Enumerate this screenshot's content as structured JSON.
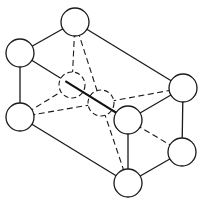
{
  "diagram": {
    "type": "crystal-lattice-unit-cell",
    "background": "#ffffff",
    "stroke_color": "#1a1a1a",
    "atom_radius": 14,
    "atoms": [
      {
        "id": "top",
        "x": 75,
        "y": 22,
        "style": "solid"
      },
      {
        "id": "upper-left",
        "x": 20,
        "y": 53,
        "style": "solid"
      },
      {
        "id": "left-mid",
        "x": 20,
        "y": 117,
        "style": "solid"
      },
      {
        "id": "right-upper",
        "x": 183,
        "y": 88,
        "style": "solid"
      },
      {
        "id": "right-lower",
        "x": 182,
        "y": 152,
        "style": "solid"
      },
      {
        "id": "bottom",
        "x": 128,
        "y": 183,
        "style": "solid"
      },
      {
        "id": "front-mid",
        "x": 128,
        "y": 120,
        "style": "solid"
      },
      {
        "id": "hidden-1",
        "x": 72,
        "y": 85,
        "style": "hidden"
      },
      {
        "id": "hidden-2",
        "x": 101,
        "y": 103,
        "style": "hidden"
      }
    ],
    "edges": [
      {
        "from": "top",
        "to": "upper-left",
        "style": "solid"
      },
      {
        "from": "top",
        "to": "right-upper",
        "style": "solid"
      },
      {
        "from": "upper-left",
        "to": "left-mid",
        "style": "solid"
      },
      {
        "from": "left-mid",
        "to": "bottom",
        "style": "solid"
      },
      {
        "from": "right-upper",
        "to": "right-lower",
        "style": "solid"
      },
      {
        "from": "right-lower",
        "to": "bottom",
        "style": "solid"
      },
      {
        "from": "front-mid",
        "to": "bottom",
        "style": "solid"
      },
      {
        "from": "front-mid",
        "to": "right-upper",
        "style": "solid"
      },
      {
        "from": "upper-left",
        "to": "front-mid",
        "style": "solid-diagonal"
      },
      {
        "from": "top",
        "to": "hidden-1",
        "style": "dashed"
      },
      {
        "from": "top",
        "to": "hidden-2",
        "style": "dashed"
      },
      {
        "from": "left-mid",
        "to": "hidden-1",
        "style": "dashed"
      },
      {
        "from": "left-mid",
        "to": "hidden-2",
        "style": "dashed"
      },
      {
        "from": "hidden-2",
        "to": "right-upper",
        "style": "dashed"
      },
      {
        "from": "hidden-2",
        "to": "bottom",
        "style": "dashed"
      },
      {
        "from": "front-mid",
        "to": "right-lower",
        "style": "dashed"
      }
    ]
  }
}
